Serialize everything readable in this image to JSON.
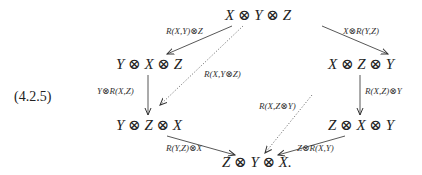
{
  "equation_number": "(4.2.5)",
  "nodes": {
    "top": "X ⊗ Y ⊗ Z",
    "left_upper": "Y ⊗ X ⊗ Z",
    "right_upper": "X ⊗ Z ⊗ Y",
    "left_lower": "Y ⊗ Z ⊗ X",
    "right_lower": "Z ⊗ X ⊗ Y",
    "bottom": "Z ⊗ Y ⊗ X."
  },
  "arrows": {
    "top_to_left_upper": "R(X,Y)⊗Z",
    "top_to_right_upper": "X⊗R(Y,Z)",
    "left_upper_to_left_lower": "Y⊗R(X,Z)",
    "right_upper_to_right_lower": "R(X,Z)⊗Y",
    "left_lower_to_bottom": "R(Y,Z)⊗X",
    "right_lower_to_bottom": "Z⊗R(X,Y)",
    "top_to_left_lower_dotted": "R(X,Y⊗Z)",
    "right_upper_to_bottom_dotted": "R(X,Z⊗Y)"
  }
}
